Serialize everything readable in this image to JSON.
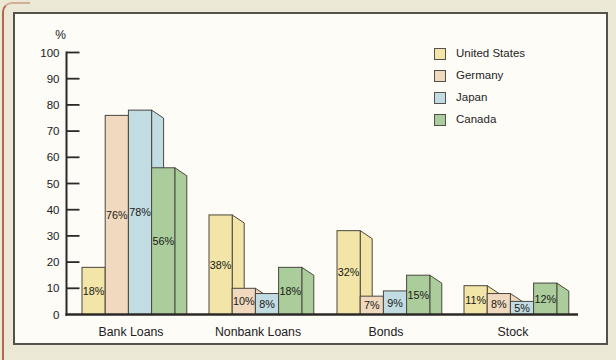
{
  "page": {
    "background_color": "#ECE8D6",
    "edge_line_color": "#B4674B",
    "panel_background": "#FDFCF7",
    "panel_border_color": "#56524B"
  },
  "chart_data": {
    "type": "bar",
    "title": "",
    "unit_label": "%",
    "value_suffix": "%",
    "categories": [
      "Bank Loans",
      "Nonbank Loans",
      "Bonds",
      "Stock"
    ],
    "series": [
      {
        "name": "United States",
        "color": "#F2E5A7",
        "values": [
          18,
          38,
          32,
          11
        ]
      },
      {
        "name": "Germany",
        "color": "#F0D9BE",
        "values": [
          76,
          10,
          7,
          8
        ]
      },
      {
        "name": "Japan",
        "color": "#C1DCE2",
        "values": [
          78,
          8,
          9,
          5
        ]
      },
      {
        "name": "Canada",
        "color": "#ABCC9B",
        "values": [
          56,
          18,
          15,
          12
        ]
      }
    ],
    "yticks": [
      0,
      10,
      20,
      30,
      40,
      50,
      60,
      70,
      80,
      90,
      100
    ],
    "ylim": [
      0,
      100
    ],
    "grid": false,
    "legend_position": "top-right",
    "bar_style": "3d-offset-side-panel",
    "axis_color": "#2B2A26",
    "bar_outline_color": "#4A463F",
    "label_color": "#1B1A17"
  }
}
